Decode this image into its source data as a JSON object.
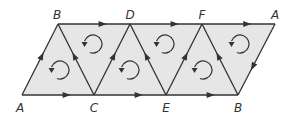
{
  "diagram": {
    "type": "triangulated-strip-with-orientation",
    "colors": {
      "fill": "#e6e6e6",
      "stroke": "#333333",
      "label": "#333333"
    },
    "vertices": {
      "bottom": [
        {
          "id": "A_bottom",
          "label": "A",
          "x": 22,
          "y": 95
        },
        {
          "id": "C",
          "label": "C",
          "x": 94,
          "y": 95
        },
        {
          "id": "E",
          "label": "E",
          "x": 166,
          "y": 95
        },
        {
          "id": "B_bottom",
          "label": "B",
          "x": 238,
          "y": 95
        }
      ],
      "top": [
        {
          "id": "B_top",
          "label": "B",
          "x": 58,
          "y": 24
        },
        {
          "id": "D",
          "label": "D",
          "x": 130,
          "y": 24
        },
        {
          "id": "F",
          "label": "F",
          "x": 202,
          "y": 24
        },
        {
          "id": "A_top",
          "label": "A",
          "x": 275,
          "y": 24
        }
      ]
    },
    "directed_edges": [
      {
        "from": "A",
        "to": "C",
        "position": "bottom"
      },
      {
        "from": "C",
        "to": "E",
        "position": "bottom"
      },
      {
        "from": "E",
        "to": "B",
        "position": "bottom"
      },
      {
        "from": "B",
        "to": "D",
        "position": "top"
      },
      {
        "from": "D",
        "to": "F",
        "position": "top"
      },
      {
        "from": "F",
        "to": "A",
        "position": "top"
      },
      {
        "from": "A",
        "to": "B",
        "position": "left-edge"
      },
      {
        "from": "C",
        "to": "B",
        "position": "diagonal"
      },
      {
        "from": "C",
        "to": "D",
        "position": "diagonal"
      },
      {
        "from": "E",
        "to": "D",
        "position": "diagonal"
      },
      {
        "from": "E",
        "to": "F",
        "position": "diagonal"
      },
      {
        "from": "B",
        "to": "F",
        "position": "diagonal"
      },
      {
        "from": "A",
        "to": "B",
        "position": "right-edge"
      }
    ],
    "triangles": [
      {
        "vertices": [
          "A",
          "C",
          "B"
        ],
        "orientation": "counterclockwise",
        "cx": 60,
        "cy": 70
      },
      {
        "vertices": [
          "B",
          "C",
          "D"
        ],
        "orientation": "counterclockwise",
        "cx": 93,
        "cy": 44
      },
      {
        "vertices": [
          "C",
          "E",
          "D"
        ],
        "orientation": "counterclockwise",
        "cx": 130,
        "cy": 70
      },
      {
        "vertices": [
          "D",
          "E",
          "F"
        ],
        "orientation": "counterclockwise",
        "cx": 165,
        "cy": 44
      },
      {
        "vertices": [
          "E",
          "B",
          "F"
        ],
        "orientation": "counterclockwise",
        "cx": 203,
        "cy": 70
      },
      {
        "vertices": [
          "F",
          "B",
          "A"
        ],
        "orientation": "counterclockwise",
        "cx": 240,
        "cy": 44
      }
    ]
  }
}
